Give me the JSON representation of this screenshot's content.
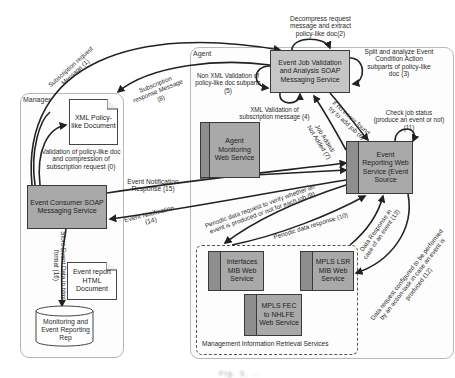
{
  "containers": {
    "manager": {
      "title": "Manager"
    },
    "agent": {
      "title": "Agent"
    },
    "mir": {
      "title": "Management Information Retrieval Services"
    }
  },
  "services": {
    "event_job_validation": "Event Job Validation and Analysis SOAP Messaging Service",
    "agent_monitoring": "Agent Monitoring Web Service",
    "event_reporting": "Event Reporting Web Service (Event Source",
    "event_consumer": "Event Consumer SOAP Messaging Service",
    "interfaces_mib": "Interfaces MIB Web Service",
    "mpls_lsr_mib": "MPLS LSR MIB Web Service",
    "mpls_fec": "MPLS FEC to NHLFE Web Service"
  },
  "documents": {
    "xml_policy": "XML Policy-like Document",
    "event_report": "Event report HTML Document"
  },
  "repository": {
    "label": "Monitoring and Event Reporting Rep"
  },
  "labels": {
    "step0": "Validation of policy-like doc and compression of subscription request (0)",
    "step1": "Subscription request Message (1)",
    "step2": "Decompress request message and extract policy-like doc(2)",
    "step3": "Split and analyze Event Condition Action subparts of policy-like doc (3)",
    "step4": "XML Validation of subscription message (4)",
    "step5": "Non XML Validation of policy-like doc subparts (5)",
    "step6": "if no errors found try to add job (6)",
    "step7": "Job Added/ Not Added (7)",
    "step8": "Subscription response Message (8)",
    "step9": "Periodic data request to verify whether an event is produced or not for each job (9)",
    "step10": "Periodic data response (10)",
    "step11": "Check job status (produce an event or not) (11)",
    "step12": "Data request configured to be performed by an action-task in case an event is produced (12)",
    "step13": "Data Response in case of an event (13)",
    "step14": "Event Notification (14)",
    "step15": "Event Notification Response (15)",
    "step16": "Store Event Data in html format (16)"
  },
  "caption": "Fig. 3. ..."
}
